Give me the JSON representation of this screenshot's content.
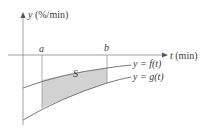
{
  "diagram": {
    "y_axis_label": "y (%/min)",
    "y_axis_var": "y",
    "y_axis_unit": "(%/min)",
    "t_axis_var": "t",
    "t_axis_unit": "(min)",
    "bound_a": "a",
    "bound_b": "b",
    "region_label": "S",
    "curve_f_label": "y = f(t)",
    "curve_g_label": "y = g(t)",
    "colors": {
      "axis": "#8a8a8a",
      "curve": "#6a6a6a",
      "shade": "#d2d2d2",
      "text": "#3a3a3a"
    }
  }
}
